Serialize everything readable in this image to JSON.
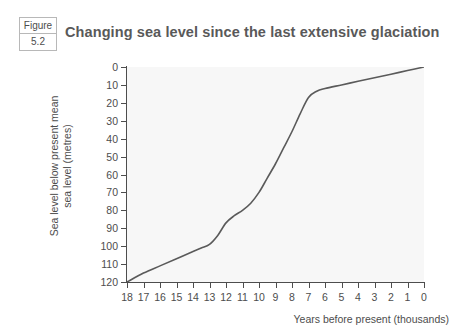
{
  "figure": {
    "badge_word": "Figure",
    "badge_number": "5.2",
    "title": "Changing sea level since the last extensive glaciation"
  },
  "chart_data": {
    "type": "line",
    "title": "Changing sea level since the last extensive glaciation",
    "xlabel": "Years before present (thousands)",
    "ylabel": "Sea level below present mean sea level (metres)",
    "ylabel_line1": "Sea level below present mean",
    "ylabel_line2": "sea level (metres)",
    "x_ticks": [
      "18",
      "17",
      "16",
      "15",
      "14",
      "13",
      "12",
      "11",
      "10",
      "9",
      "8",
      "7",
      "6",
      "5",
      "4",
      "3",
      "2",
      "1",
      "0"
    ],
    "y_ticks": [
      "0",
      "10",
      "20",
      "30",
      "40",
      "50",
      "60",
      "70",
      "80",
      "90",
      "100",
      "110",
      "120"
    ],
    "xlim": [
      18,
      0
    ],
    "ylim": [
      120,
      0
    ],
    "y_inverted": true,
    "grid": false,
    "legend": "none",
    "line_color": "#5a5a5a",
    "plot_background": "#f7f7f7",
    "axis_color": "#4d4d4d",
    "series": [
      {
        "name": "Sea level below present mean sea level",
        "x": [
          18,
          17,
          16,
          15,
          14,
          13.5,
          13,
          12.5,
          12,
          11.5,
          11,
          10.5,
          10,
          9.5,
          9,
          8.5,
          8,
          7.5,
          7,
          6.5,
          6,
          5,
          4,
          3,
          2,
          1,
          0
        ],
        "values": [
          120,
          115,
          111,
          107,
          103,
          101,
          99,
          94,
          87,
          83,
          80,
          76,
          70,
          62,
          54,
          45,
          36,
          26,
          17,
          13.5,
          12,
          10,
          8,
          6,
          4,
          2,
          0
        ]
      }
    ]
  }
}
